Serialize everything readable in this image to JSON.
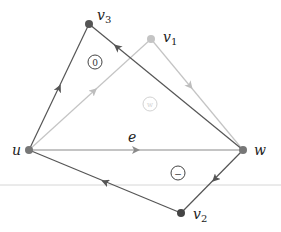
{
  "diagram": {
    "colors": {
      "dark_edge": "#555555",
      "light_edge": "#bdbdbd",
      "mid_edge": "#8a8a8a",
      "vertex_dark": "#555555",
      "vertex_light": "#bdbdbd",
      "rule_line": "#d0d0d0"
    },
    "vertices": [
      {
        "id": "u",
        "label": "u",
        "sub": "",
        "x": 29,
        "y": 150,
        "tone": "dark"
      },
      {
        "id": "w",
        "label": "w",
        "sub": "",
        "x": 243,
        "y": 150,
        "tone": "dark"
      },
      {
        "id": "v3",
        "label": "v",
        "sub": "3",
        "x": 89,
        "y": 24,
        "tone": "dark"
      },
      {
        "id": "v1",
        "label": "v",
        "sub": "1",
        "x": 151,
        "y": 39,
        "tone": "light"
      },
      {
        "id": "v2",
        "label": "v",
        "sub": "2",
        "x": 181,
        "y": 213,
        "tone": "dark"
      }
    ],
    "edges": [
      {
        "from": "u",
        "to": "v3",
        "tone": "dark",
        "label": ""
      },
      {
        "from": "w",
        "to": "v3",
        "tone": "dark",
        "label": ""
      },
      {
        "from": "u",
        "to": "v1",
        "tone": "light",
        "label": ""
      },
      {
        "from": "v1",
        "to": "w",
        "tone": "light",
        "label": ""
      },
      {
        "from": "u",
        "to": "w",
        "tone": "mid",
        "label": "e"
      },
      {
        "from": "w",
        "to": "v2",
        "tone": "dark",
        "label": ""
      },
      {
        "from": "v2",
        "to": "u",
        "tone": "dark",
        "label": ""
      }
    ],
    "face_labels": [
      {
        "text": "0",
        "x": 95,
        "y": 62,
        "tone": "dark"
      },
      {
        "text": "w",
        "x": 150,
        "y": 104,
        "tone": "faint"
      },
      {
        "text": "−",
        "x": 178,
        "y": 173,
        "tone": "dark"
      }
    ],
    "edge_label_e": "e",
    "label_u": "u",
    "label_w": "w",
    "label_v": "v",
    "sub_1": "1",
    "sub_2": "2",
    "sub_3": "3",
    "face_0": "0",
    "face_mid": "w",
    "face_minus": "−"
  }
}
